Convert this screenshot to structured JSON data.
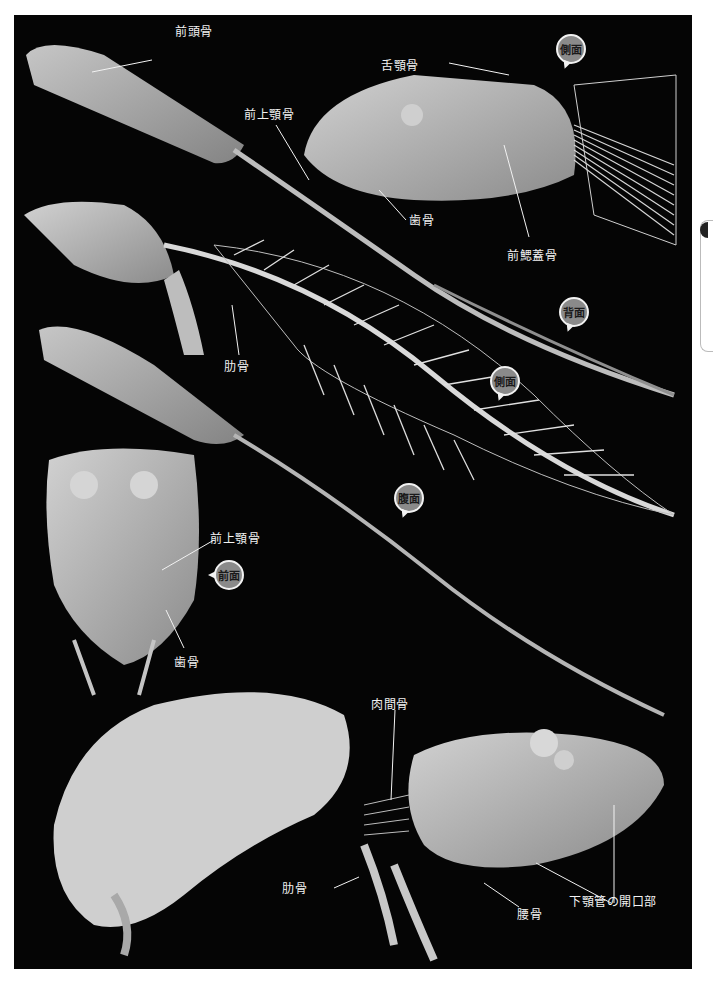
{
  "figure": {
    "colors": {
      "background": "#050505",
      "page": "#ffffff",
      "label_text": "#f2f2f2",
      "badge_fill": "#8a8a8a",
      "badge_outline": "#f2f2f2"
    }
  },
  "badges": {
    "lateral_top": "側面",
    "dorsal": "背面",
    "lateral_mid": "側面",
    "ventral": "腹面",
    "frontal": "前面"
  },
  "labels": {
    "frontal_bone": "前頭骨",
    "premaxilla_top": "前上顎骨",
    "hyomandibula": "舌顎骨",
    "dentary_top": "歯骨",
    "preopercle": "前鰓蓋骨",
    "rib_mid": "肋骨",
    "premaxilla_front": "前上顎骨",
    "dentary_front": "歯骨",
    "intermuscular_bone": "肉間骨",
    "rib_bottom": "肋骨",
    "pelvic_bone": "腰骨",
    "mandibular_canal_opening": "下顎管の開口部"
  }
}
